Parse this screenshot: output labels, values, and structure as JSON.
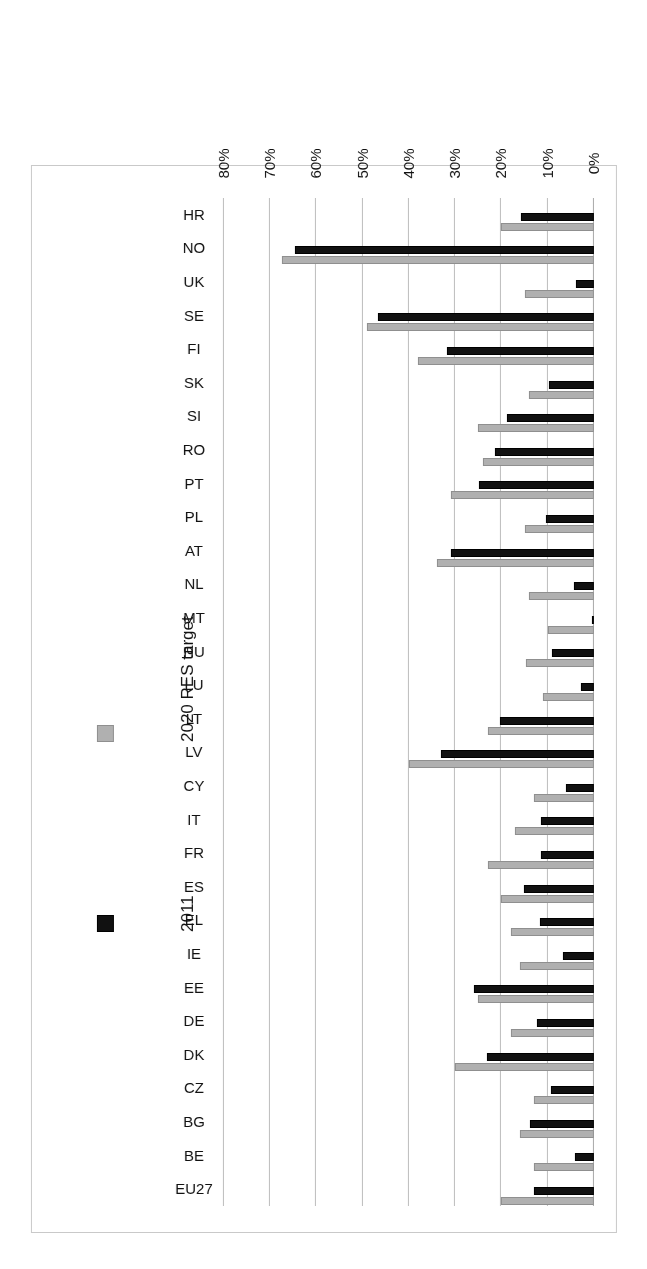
{
  "figure": {
    "rotation_deg": 180,
    "background": "#ffffff",
    "frame_border": "#c9c9c9"
  },
  "legend": {
    "position": "right-inside",
    "entries": [
      {
        "label": "2011",
        "color": "#111111",
        "swatch": "black-square-swatch"
      },
      {
        "label": "2020 RES target",
        "color": "#b0b0b0",
        "swatch": "grey-square-swatch"
      }
    ]
  },
  "axis": {
    "tick_labels": [
      "0%",
      "10%",
      "20%",
      "30%",
      "40%",
      "50%",
      "60%",
      "70%",
      "80%"
    ],
    "tick_values": [
      0,
      10,
      20,
      30,
      40,
      50,
      60,
      70,
      80
    ],
    "min": 0,
    "max": 80,
    "gridlines": true
  },
  "chart_data": {
    "type": "bar",
    "orientation": "horizontal",
    "title": "",
    "subtitle": "",
    "xlabel": "",
    "ylabel": "",
    "xlim": [
      0,
      80
    ],
    "grid": true,
    "legend_position": "right",
    "categories": [
      "EU27",
      "BE",
      "BG",
      "CZ",
      "DK",
      "DE",
      "EE",
      "IE",
      "EL",
      "ES",
      "FR",
      "IT",
      "CY",
      "LV",
      "LT",
      "LU",
      "HU",
      "MT",
      "NL",
      "AT",
      "PL",
      "PT",
      "RO",
      "SI",
      "SK",
      "FI",
      "SE",
      "UK",
      "NO",
      "HR"
    ],
    "series": [
      {
        "name": "2011",
        "color": "#111111",
        "values": [
          13.0,
          4.1,
          13.8,
          9.4,
          23.1,
          12.3,
          25.9,
          6.7,
          11.6,
          15.1,
          11.5,
          11.5,
          6.0,
          33.1,
          20.3,
          2.9,
          9.1,
          0.4,
          4.3,
          30.9,
          10.4,
          24.9,
          21.4,
          18.8,
          9.7,
          31.8,
          46.8,
          3.8,
          64.7,
          15.7
        ]
      },
      {
        "name": "2020 RES target",
        "color": "#b0b0b0",
        "values": [
          20.0,
          13.0,
          16.0,
          13.0,
          30.0,
          18.0,
          25.0,
          16.0,
          18.0,
          20.0,
          23.0,
          17.0,
          13.0,
          40.0,
          23.0,
          11.0,
          14.8,
          10.0,
          14.0,
          34.0,
          15.0,
          31.0,
          24.0,
          25.0,
          14.0,
          38.0,
          49.0,
          15.0,
          67.5,
          20.0
        ]
      }
    ]
  }
}
